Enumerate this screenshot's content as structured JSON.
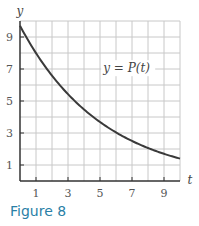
{
  "chart_data": {
    "type": "line",
    "title": "",
    "xlabel": "t",
    "ylabel": "y",
    "xlim": [
      0,
      10
    ],
    "ylim": [
      0,
      10
    ],
    "grid": true,
    "x_ticks": [
      1,
      3,
      5,
      7,
      9
    ],
    "y_ticks": [
      1,
      3,
      5,
      7,
      9
    ],
    "series": [
      {
        "name": "y = P(t)",
        "x": [
          0,
          1,
          2,
          3,
          4,
          5,
          6,
          7,
          8,
          9,
          10
        ],
        "values": [
          9.7,
          8.0,
          6.6,
          5.4,
          4.5,
          3.7,
          3.0,
          2.5,
          2.1,
          1.7,
          1.4
        ]
      }
    ],
    "annotations": [
      {
        "text": "y = P(t)",
        "x": 5.2,
        "y": 6.8
      }
    ]
  },
  "labels": {
    "x_axis": "t",
    "y_axis": "y",
    "curve": "y = P(t)",
    "caption": "Figure 8"
  },
  "colors": {
    "curve": "#3a3a3a",
    "grid": "#c8c8c8",
    "axis": "#333333",
    "caption": "#2a7fa6"
  }
}
